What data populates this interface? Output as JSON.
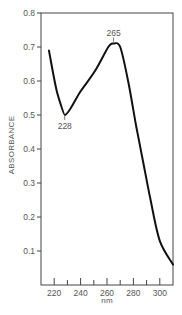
{
  "chart_data": {
    "type": "line",
    "title": "",
    "xlabel": "nm",
    "ylabel": "ABSORBANCE",
    "xlim": [
      210,
      310
    ],
    "ylim": [
      0,
      0.8
    ],
    "grid": false,
    "legend": null,
    "x_ticks_major": [
      220,
      240,
      260,
      280,
      300
    ],
    "x_ticks_minor": [
      230,
      250,
      270,
      290
    ],
    "x_tick_labels": [
      "220",
      "240",
      "260",
      "280",
      "300"
    ],
    "y_ticks": [
      0.1,
      0.2,
      0.3,
      0.4,
      0.5,
      0.6,
      0.7,
      0.8
    ],
    "y_tick_labels": [
      "0.1",
      "0.2",
      "0.3",
      "0.4",
      "0.5",
      "0.6",
      "0.7",
      "0.8"
    ],
    "series": [
      {
        "name": "absorption spectrum",
        "x": [
          216,
          222,
          228,
          240,
          251,
          261,
          265,
          270,
          276,
          282,
          287,
          293,
          300,
          310
        ],
        "y": [
          0.69,
          0.57,
          0.5,
          0.57,
          0.63,
          0.7,
          0.71,
          0.7,
          0.6,
          0.47,
          0.37,
          0.25,
          0.13,
          0.06
        ]
      }
    ],
    "annotations": [
      {
        "text": "228",
        "x": 228,
        "y": 0.5,
        "position": "below"
      },
      {
        "text": "265",
        "x": 265,
        "y": 0.71,
        "position": "above"
      }
    ]
  }
}
